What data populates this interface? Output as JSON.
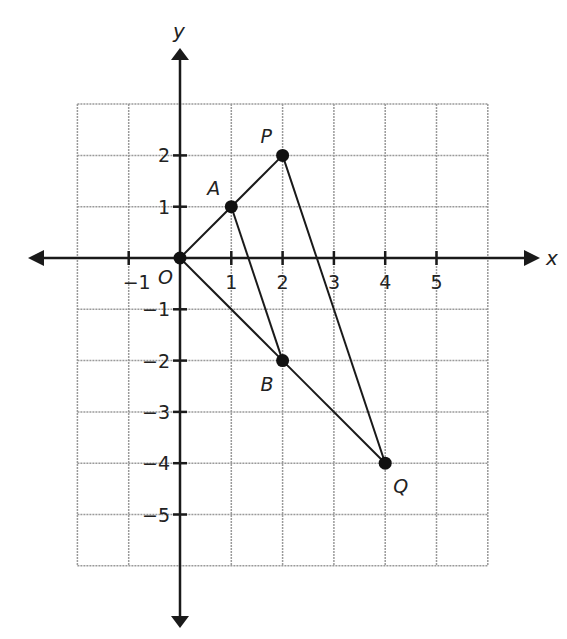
{
  "diagram": {
    "type": "coordinate-plane",
    "axes": {
      "x_label": "x",
      "y_label": "y"
    },
    "grid": {
      "x_min": -2,
      "x_max": 6,
      "y_min": -6,
      "y_max": 3
    },
    "x_ticks": [
      "-1",
      "1",
      "2",
      "3",
      "4",
      "5"
    ],
    "y_ticks": [
      "2",
      "1",
      "-1",
      "-2",
      "-3",
      "-4",
      "-5"
    ],
    "points": [
      {
        "name": "O",
        "x": 0,
        "y": 0
      },
      {
        "name": "A",
        "x": 1,
        "y": 1
      },
      {
        "name": "P",
        "x": 2,
        "y": 2
      },
      {
        "name": "B",
        "x": 2,
        "y": -2
      },
      {
        "name": "Q",
        "x": 4,
        "y": -4
      }
    ],
    "segments": [
      [
        "O",
        "A"
      ],
      [
        "A",
        "P"
      ],
      [
        "O",
        "B"
      ],
      [
        "B",
        "Q"
      ],
      [
        "A",
        "B"
      ],
      [
        "P",
        "Q"
      ]
    ]
  }
}
